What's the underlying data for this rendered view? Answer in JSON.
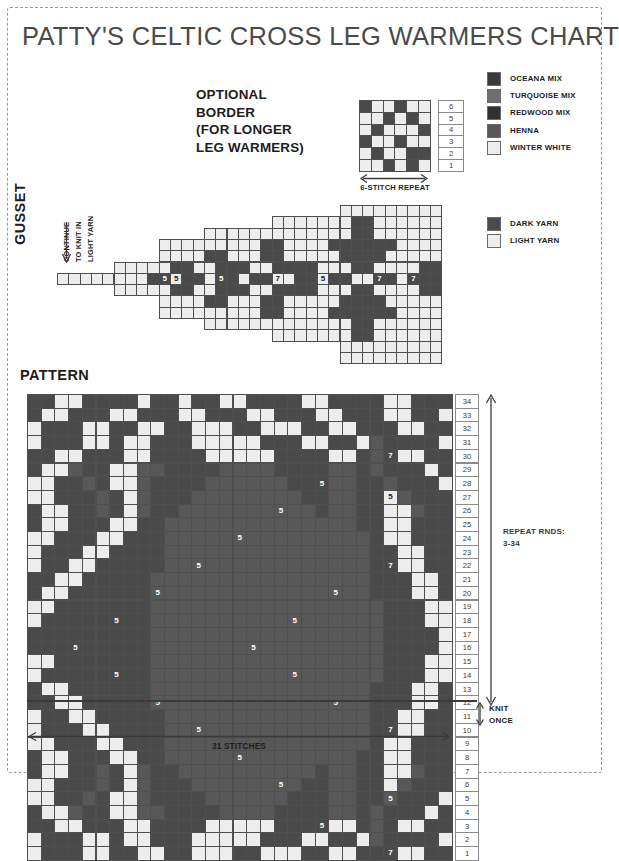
{
  "title": "PATTY'S CELTIC CROSS LEG WARMERS CHART",
  "colors": {
    "oceana_mix": "#3a3a3a",
    "turquoise_mix": "#6e6e6e",
    "redwood_mix": "#313131",
    "henna": "#585858",
    "winter_white": "#ededed",
    "dark_yarn": "#4a4a4a",
    "light_yarn": "#ededed",
    "grid_line": "#4f4f4f",
    "ink": "#1d1d1d"
  },
  "optional_border": {
    "heading_lines": [
      "OPTIONAL",
      "BORDER",
      "(FOR LONGER",
      "LEG WARMERS)"
    ],
    "repeat_label": "6-STITCH REPEAT",
    "stitches": 6,
    "rows": 6,
    "row_numbers": [
      "6",
      "5",
      "4",
      "3",
      "2",
      "1"
    ],
    "grid_top_to_bottom": [
      [
        "D",
        "L",
        "L",
        "D",
        "L",
        "L"
      ],
      [
        "L",
        "L",
        "D",
        "L",
        "D",
        "L"
      ],
      [
        "L",
        "D",
        "L",
        "L",
        "L",
        "D"
      ],
      [
        "D",
        "L",
        "L",
        "D",
        "L",
        "L"
      ],
      [
        "L",
        "D",
        "L",
        "L",
        "D",
        "D"
      ],
      [
        "L",
        "L",
        "D",
        "L",
        "D",
        "L"
      ]
    ]
  },
  "legend_yarns": {
    "items": [
      {
        "label": "OCEANA MIX",
        "swatch": "oceana_mix"
      },
      {
        "label": "TURQUOISE MIX",
        "swatch": "turquoise_mix"
      },
      {
        "label": "REDWOOD MIX",
        "swatch": "redwood_mix"
      },
      {
        "label": "HENNA",
        "swatch": "henna"
      },
      {
        "label": "WINTER WHITE",
        "swatch": "winter_white"
      }
    ]
  },
  "legend_shading": {
    "items": [
      {
        "label": "DARK YARN",
        "swatch": "dark_yarn"
      },
      {
        "label": "LIGHT YARN",
        "swatch": "light_yarn"
      }
    ]
  },
  "gusset": {
    "section_label": "GUSSET",
    "notes": [
      "CONTINUE",
      "TO KNIT IN",
      "LIGHT YARN"
    ],
    "arrow": "down-arrow",
    "cell": 11.3,
    "cols": 34,
    "rows": 14,
    "row_offsets_px": [
      0,
      0,
      0,
      0,
      0,
      0,
      0,
      0,
      0,
      0,
      0,
      0,
      0,
      0
    ],
    "grid_top_to_bottom": [
      "                         LLLLLLLLL",
      "                   LLLLLLLDDLLLLLL",
      "             LLLLLLLLLLLLLDDLLLLLL",
      "         LLLLLLLLLDDLLLLDDDDDDLLLL",
      "         LLLLDDLLLDDLLLLLDDDDLLLLL",
      "     LLLLLDDLLDDDLLDDDDLLLDDLLLLDD",
      "LLLLLLLLDDLDDLDDLDDLLDDLDDLLDDLDDD",
      "     LLLLLDDLLDDDLLDDDDLLLDDLLLLDD",
      "         LLLLDDLLLDDLLLLLDDDDLLLLL",
      "         LLLLLLLLLDDLLLLDDDDDDLLLL",
      "             LLLLLLLLLLLLLDDLLLLLL",
      "                   LLLLLLLDDLLLLLL",
      "                         LLLLLLLLL",
      "                         LLLLLLLLL"
    ],
    "symbols": [
      {
        "row": 6,
        "col": 9,
        "text": "5"
      },
      {
        "row": 6,
        "col": 10,
        "text": "5"
      },
      {
        "row": 6,
        "col": 14,
        "text": "5"
      },
      {
        "row": 6,
        "col": 19,
        "text": "7"
      },
      {
        "row": 6,
        "col": 23,
        "text": "5"
      },
      {
        "row": 6,
        "col": 28,
        "text": "7"
      },
      {
        "row": 6,
        "col": 31,
        "text": "7"
      }
    ]
  },
  "pattern": {
    "section_label": "PATTERN",
    "stitches_label": "31 STITCHES",
    "stitches": 31,
    "rows": 34,
    "cell": 13.7,
    "repeat_note_lines": [
      "REPEAT RNDS:",
      "3-34"
    ],
    "knit_once_lines": [
      "KNIT",
      "ONCE"
    ],
    "knit_once_after_row": 2,
    "row_numbers": [
      "34",
      "33",
      "32",
      "31",
      "30",
      "29",
      "28",
      "27",
      "26",
      "25",
      "24",
      "23",
      "22",
      "21",
      "20",
      "19",
      "18",
      "17",
      "16",
      "15",
      "14",
      "13",
      "12",
      "11",
      "10",
      "9",
      "8",
      "7",
      "6",
      "5",
      "4",
      "3",
      "2",
      "1"
    ],
    "grid_top_to_bottom": [
      "DDLLDDDDLDDLDDLLDDDDLLDDDDLLDDD",
      "DLLDDDLLDDDLLDDDLLDDDLLDDDLLDDL",
      "LDDDLLDDLLDDLLLDDLLLDDLLDDDLLDD",
      "LDDDLLDLLDDDLLLLLDDDLLDDLHDDDDL",
      "DDLLDDDLLDDDDLLLLLDDDDLLDHDLLDD",
      "DLLHDDLLHHDDDDHHHHDDDDHHDHDDDLD",
      "LLDDHDLLHDDDDHHHHHHDDDHHDDHDDDL",
      "LLDDDHDLHDDDHHHHHHHHDDHHDDLHDDD",
      "DLLDDHDLHDDHHHHHHHHHHDHHDDLLHDD",
      "DLLDDDLLDDHHHHHHHHHHHHHHDDLLDDD",
      "LLDDDLLDDDHHHHHHHHHHHHHHHDLLDDD",
      "LDDDLLDDDDHHHHHHHHHHHHHHHDDLLDD",
      "LDDLLDDDDDHHHHHHHHHHHHHHHDDLLDD",
      "DDLLDDDDDHHHHHHHHHHHHHHHHDDDLLD",
      "DLLDDDDDDHHHHHHHHHHHHHHHHDDDLLD",
      "LLDDDDDDDHHHHHHHHHHHHHHHHHDDDLL",
      "LDDDDDDDDHHHHHHHHHHHHHHHHHDDDLL",
      "DDDDDDDDDHHHHHHHHHHHHHHHHHDDDDL",
      "DDDDDDDDDHHHHHHHHHHHHHHHHHDDDDL",
      "LLDDDDDDDHHHHHHHHHHHHHHHHHDDDLL",
      "LDDDDDDDDHHHHHHHHHHHHHHHHHDDDLL",
      "DLLDDDDDDHHHHHHHHHHHHHHHHDDDLLD",
      "DDLLDDDDDHHHHHHHHHHHHHHHHDDDLLD",
      "LDDLLDDDDDHHHHHHHHHHHHHHHDDLLDD",
      "LDDDLLDDDDHHHHHHHHHHHHHHHDDLLDD",
      "LLDDDLLDDDHHHHHHHHHHHHHHHDLLDDD",
      "DLLDDDLLDDHHHHHHHHHHHHHHDDLLDDD",
      "DLLDDHDLHDDHHHHHHHHHHDHHDDLLHDD",
      "LLDDDHDLHDDDHHHHHHHHDDHHDDLHDDD",
      "LLDDHDLLHDDDDHHHHHHDDDHHDDHDDDL",
      "DLLHDDLLHHDDDDHHHHDDDDHHDHDDDLD",
      "DDLLDDDLLDDDDLLLLLDDDDLLDHDLLDD",
      "LDDDLLDLLDDDLLLLLDDDLLDDLHDDDDL",
      "LDDDLLDDLLDDLLLDDLLLDDLLDDDLLDD"
    ],
    "symbols": [
      {
        "row": 4,
        "col": 26,
        "text": "7"
      },
      {
        "row": 6,
        "col": 21,
        "text": "5"
      },
      {
        "row": 7,
        "col": 26,
        "text": "5"
      },
      {
        "row": 8,
        "col": 18,
        "text": "5"
      },
      {
        "row": 10,
        "col": 15,
        "text": "5"
      },
      {
        "row": 12,
        "col": 12,
        "text": "5"
      },
      {
        "row": 12,
        "col": 26,
        "text": "7"
      },
      {
        "row": 14,
        "col": 9,
        "text": "5"
      },
      {
        "row": 14,
        "col": 22,
        "text": "5"
      },
      {
        "row": 16,
        "col": 6,
        "text": "5"
      },
      {
        "row": 16,
        "col": 19,
        "text": "5"
      },
      {
        "row": 18,
        "col": 3,
        "text": "5"
      },
      {
        "row": 18,
        "col": 16,
        "text": "5"
      },
      {
        "row": 20,
        "col": 6,
        "text": "5"
      },
      {
        "row": 20,
        "col": 19,
        "text": "5"
      },
      {
        "row": 22,
        "col": 9,
        "text": "5"
      },
      {
        "row": 22,
        "col": 22,
        "text": "5"
      },
      {
        "row": 24,
        "col": 12,
        "text": "5"
      },
      {
        "row": 24,
        "col": 26,
        "text": "7"
      },
      {
        "row": 26,
        "col": 15,
        "text": "5"
      },
      {
        "row": 28,
        "col": 18,
        "text": "5"
      },
      {
        "row": 29,
        "col": 26,
        "text": "5"
      },
      {
        "row": 31,
        "col": 21,
        "text": "5"
      },
      {
        "row": 33,
        "col": 26,
        "text": "7"
      }
    ]
  }
}
